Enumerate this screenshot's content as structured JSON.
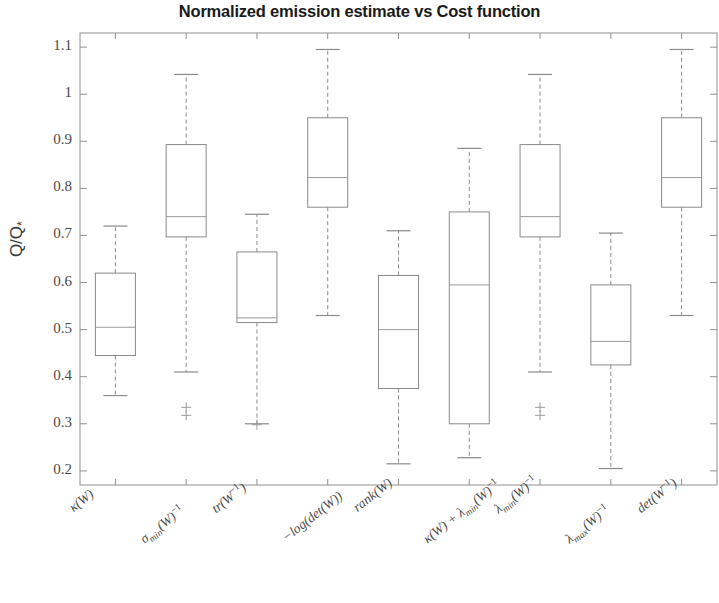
{
  "chart_data": {
    "type": "box",
    "title": "Normalized emission estimate vs Cost function",
    "xlabel": "",
    "ylabel": "Q/Q*",
    "ylim": [
      0.17,
      1.13
    ],
    "yticks": [
      "0.2",
      "0.3",
      "0.4",
      "0.5",
      "0.6",
      "0.7",
      "0.8",
      "0.9",
      "1",
      "1.1"
    ],
    "ytick_values": [
      0.2,
      0.3,
      0.4,
      0.5,
      0.6,
      0.7,
      0.8,
      0.9,
      1.0,
      1.1
    ],
    "grid": false,
    "legend": "none",
    "categories": [
      "κ(W)",
      "σ_min(W)^-1",
      "tr(W^-1)",
      "-log(det(W))",
      "rank(W)",
      "κ(W) + λ_min(W)^-1",
      "λ_min(W)^-1",
      "λ_max(W)^-1",
      "det(W^-1)"
    ],
    "boxes": [
      {
        "label": "κ(W)",
        "whisker_low": 0.36,
        "q1": 0.445,
        "median": 0.505,
        "q3": 0.62,
        "whisker_high": 0.72,
        "outliers": []
      },
      {
        "label": "σ_min(W)^-1",
        "whisker_low": 0.41,
        "q1": 0.697,
        "median": 0.74,
        "q3": 0.893,
        "whisker_high": 1.042,
        "outliers": [
          0.335,
          0.318
        ]
      },
      {
        "label": "tr(W^-1)",
        "whisker_low": 0.3,
        "q1": 0.515,
        "median": 0.525,
        "q3": 0.665,
        "whisker_high": 0.745,
        "outliers": [
          0.298
        ]
      },
      {
        "label": "-log(det(W))",
        "whisker_low": 0.53,
        "q1": 0.76,
        "median": 0.823,
        "q3": 0.95,
        "whisker_high": 1.095,
        "outliers": []
      },
      {
        "label": "rank(W)",
        "whisker_low": 0.215,
        "q1": 0.375,
        "median": 0.5,
        "q3": 0.615,
        "whisker_high": 0.71,
        "outliers": []
      },
      {
        "label": "κ(W) + λ_min(W)^-1",
        "whisker_low": 0.228,
        "q1": 0.3,
        "median": 0.595,
        "q3": 0.75,
        "whisker_high": 0.885,
        "outliers": []
      },
      {
        "label": "λ_min(W)^-1",
        "whisker_low": 0.41,
        "q1": 0.697,
        "median": 0.74,
        "q3": 0.893,
        "whisker_high": 1.042,
        "outliers": [
          0.335,
          0.318
        ]
      },
      {
        "label": "λ_max(W)^-1",
        "whisker_low": 0.205,
        "q1": 0.425,
        "median": 0.475,
        "q3": 0.595,
        "whisker_high": 0.705,
        "outliers": []
      },
      {
        "label": "det(W^-1)",
        "whisker_low": 0.53,
        "q1": 0.76,
        "median": 0.823,
        "q3": 0.95,
        "whisker_high": 1.095,
        "outliers": []
      }
    ],
    "colors": {
      "box": "#8a8a8a",
      "median": "#9a9a9a",
      "whisker": "#8a8a8a",
      "outlier": "#9a9a9a",
      "axis": "#909090",
      "title": "#1a1a1a",
      "tick_text": "#4a4a4a",
      "background": "#ffffff"
    }
  }
}
